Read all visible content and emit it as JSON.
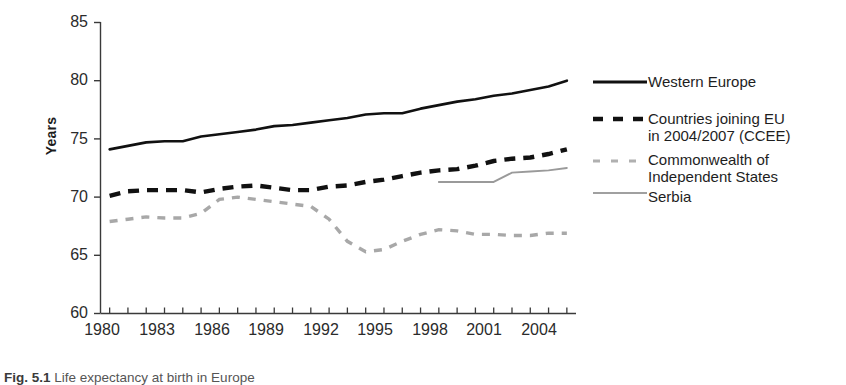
{
  "chart_data": {
    "type": "line",
    "title": "",
    "xlabel": "",
    "ylabel": "Years",
    "xlim": [
      1979.5,
      2005.5
    ],
    "ylim": [
      60,
      85
    ],
    "yticks": [
      60,
      65,
      70,
      75,
      80,
      85
    ],
    "xticks": [
      1980,
      1983,
      1986,
      1989,
      1992,
      1995,
      1998,
      2001,
      2004
    ],
    "x_minor_ticks_every": 1,
    "grid": false,
    "legend_position": "right",
    "series": [
      {
        "name": "Western Europe",
        "style": "solid-thick-black",
        "color": "#111111",
        "x": [
          1980,
          1981,
          1982,
          1983,
          1984,
          1985,
          1986,
          1987,
          1988,
          1989,
          1990,
          1991,
          1992,
          1993,
          1994,
          1995,
          1996,
          1997,
          1998,
          1999,
          2000,
          2001,
          2002,
          2003,
          2004,
          2005
        ],
        "values": [
          74.1,
          74.4,
          74.7,
          74.8,
          74.8,
          75.2,
          75.4,
          75.6,
          75.8,
          76.1,
          76.2,
          76.4,
          76.6,
          76.8,
          77.1,
          77.2,
          77.2,
          77.6,
          77.9,
          78.2,
          78.4,
          78.7,
          78.9,
          79.2,
          79.5,
          80.0
        ]
      },
      {
        "name": "Countries joining EU in 2004/2007 (CCEE)",
        "style": "dashed-thick-black",
        "color": "#111111",
        "x": [
          1980,
          1981,
          1982,
          1983,
          1984,
          1985,
          1986,
          1987,
          1988,
          1989,
          1990,
          1991,
          1992,
          1993,
          1994,
          1995,
          1996,
          1997,
          1998,
          1999,
          2000,
          2001,
          2002,
          2003,
          2004,
          2005
        ],
        "values": [
          70.1,
          70.5,
          70.6,
          70.6,
          70.6,
          70.4,
          70.7,
          70.9,
          71.0,
          70.8,
          70.6,
          70.6,
          70.9,
          71.0,
          71.3,
          71.5,
          71.8,
          72.1,
          72.3,
          72.4,
          72.7,
          73.1,
          73.3,
          73.4,
          73.7,
          74.1
        ]
      },
      {
        "name": "Commonwealth of Independent States",
        "style": "dashed-thin-gray",
        "color": "#a8a8a8",
        "x": [
          1980,
          1981,
          1982,
          1983,
          1984,
          1985,
          1986,
          1987,
          1988,
          1989,
          1990,
          1991,
          1992,
          1993,
          1994,
          1995,
          1996,
          1997,
          1998,
          1999,
          2000,
          2001,
          2002,
          2003,
          2004,
          2005
        ],
        "values": [
          67.9,
          68.1,
          68.3,
          68.2,
          68.2,
          68.6,
          69.8,
          70.0,
          69.8,
          69.6,
          69.4,
          69.2,
          68.1,
          66.2,
          65.3,
          65.5,
          66.2,
          66.8,
          67.2,
          67.1,
          66.8,
          66.8,
          66.7,
          66.7,
          66.9,
          66.9
        ]
      },
      {
        "name": "Serbia",
        "style": "solid-thin-gray",
        "color": "#9a9a9a",
        "x": [
          1998,
          1999,
          2000,
          2001,
          2002,
          2003,
          2004,
          2005
        ],
        "values": [
          71.3,
          71.3,
          71.3,
          71.3,
          72.1,
          72.2,
          72.3,
          72.5
        ]
      }
    ]
  },
  "legend": {
    "items": [
      {
        "label": "Western Europe",
        "swatch": "solid-thick-black"
      },
      {
        "label": "Countries joining EU in 2004/2007 (CCEE)",
        "swatch": "dashed-thick-black"
      },
      {
        "label": "Commonwealth of Independent States",
        "swatch": "dashed-thin-gray"
      },
      {
        "label": "Serbia",
        "swatch": "solid-thin-gray"
      }
    ],
    "western_europe": "Western Europe",
    "ccee_line1": "Countries joining EU",
    "ccee_line2": "in 2004/2007 (CCEE)",
    "cis_line1": "Commonwealth of",
    "cis_line2": "Independent States",
    "serbia": "Serbia"
  },
  "axes": {
    "y_title": "Years",
    "y_tick_labels": [
      "85",
      "80",
      "75",
      "70",
      "65",
      "60"
    ],
    "x_tick_labels": [
      "1980",
      "1983",
      "1986",
      "1989",
      "1992",
      "1995",
      "1998",
      "2001",
      "2004"
    ]
  },
  "caption": {
    "figure_label": "Fig. 5.1",
    "text": "Life expectancy at birth in Europe"
  },
  "colors": {
    "axis": "#3a3a3a",
    "series_dark": "#111111",
    "series_gray": "#a8a8a8",
    "text": "#2b2b2b",
    "background": "#ffffff"
  }
}
